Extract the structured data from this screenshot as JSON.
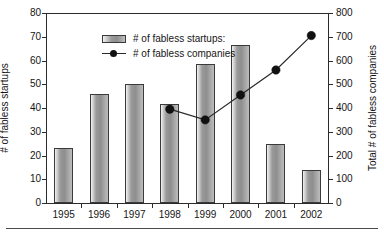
{
  "chart_data": {
    "type": "bar",
    "title": "",
    "subtitle": "",
    "categories": [
      "1995",
      "1996",
      "1997",
      "1998",
      "1999",
      "2000",
      "2001",
      "2002"
    ],
    "xlabel": "",
    "ylabel": "# of fabless startups",
    "ylabel_secondary": "Total # of fabless companies",
    "ylim": [
      0,
      80
    ],
    "ylim_secondary": [
      0,
      800
    ],
    "yticks": [
      0,
      10,
      20,
      30,
      40,
      50,
      60,
      70,
      80
    ],
    "yticks_secondary": [
      0,
      100,
      200,
      300,
      400,
      500,
      600,
      700,
      800
    ],
    "grid": false,
    "legend_position": "upper-left-inside",
    "series": [
      {
        "name": "# of fabless startups:",
        "type": "bar",
        "axis": "left",
        "values": [
          23,
          46,
          50,
          41.5,
          58.5,
          66.5,
          25,
          14
        ]
      },
      {
        "name": "# of fabless companies",
        "type": "line",
        "axis": "right",
        "x": [
          "1998",
          "1999",
          "2000",
          "2001",
          "2002"
        ],
        "values": [
          395,
          350,
          455,
          560,
          705
        ]
      }
    ]
  },
  "axes": {
    "left": {
      "label": "# of fabless startups",
      "ticks": [
        "0",
        "10",
        "20",
        "30",
        "40",
        "50",
        "60",
        "70",
        "80"
      ]
    },
    "right": {
      "label": "Total # of fabless companies",
      "ticks": [
        "0",
        "100",
        "200",
        "300",
        "400",
        "500",
        "600",
        "700",
        "800"
      ]
    },
    "x": {
      "ticks": [
        "1995",
        "1996",
        "1997",
        "1998",
        "1999",
        "2000",
        "2001",
        "2002"
      ]
    }
  },
  "legend": {
    "items": [
      {
        "label": "# of fabless startups:",
        "marker": "bar-swatch"
      },
      {
        "label": "# of fabless companies",
        "marker": "line-dot"
      }
    ]
  },
  "colors": {
    "bar_light": "#f2f2f2",
    "bar_mid": "#8e8e8e",
    "bar_edge": "#3a3a3a",
    "line": "#2a2a2a",
    "marker": "#111111",
    "axis": "#2b2b2b",
    "background": "#ffffff"
  }
}
